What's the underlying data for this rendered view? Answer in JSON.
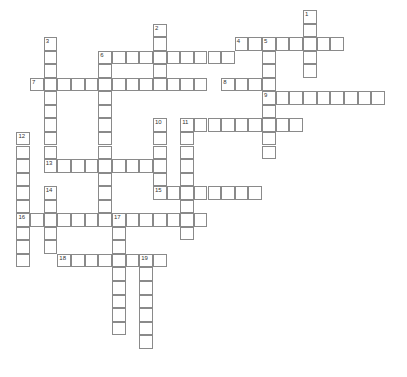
{
  "puzzle": {
    "type": "crossword",
    "grid": {
      "origin_x": 16.4,
      "origin_y": 10,
      "cell_w": 13.65,
      "cell_h": 13.55
    },
    "entries": [
      {
        "number": "1",
        "direction": "down",
        "col": 21,
        "row": 0,
        "length": 5
      },
      {
        "number": "2",
        "direction": "down",
        "col": 10,
        "row": 1,
        "length": 5
      },
      {
        "number": "3",
        "direction": "down",
        "col": 2,
        "row": 2,
        "length": 10
      },
      {
        "number": "4",
        "direction": "across",
        "col": 16,
        "row": 2,
        "length": 8
      },
      {
        "number": "5",
        "direction": "down",
        "col": 18,
        "row": 2,
        "length": 9
      },
      {
        "number": "6",
        "direction": "across",
        "col": 6,
        "row": 3,
        "length": 10
      },
      {
        "number": "6",
        "direction": "down",
        "col": 6,
        "row": 3,
        "length": 13
      },
      {
        "number": "7",
        "direction": "across",
        "col": 1,
        "row": 5,
        "length": 13
      },
      {
        "number": "8",
        "direction": "across",
        "col": 15,
        "row": 5,
        "length": 4
      },
      {
        "number": "9",
        "direction": "across",
        "col": 18,
        "row": 6,
        "length": 9
      },
      {
        "number": "10",
        "direction": "down",
        "col": 10,
        "row": 8,
        "length": 6
      },
      {
        "number": "11",
        "direction": "across",
        "col": 12,
        "row": 8,
        "length": 9
      },
      {
        "number": "11",
        "direction": "down",
        "col": 12,
        "row": 8,
        "length": 9
      },
      {
        "number": "12",
        "direction": "down",
        "col": 0,
        "row": 9,
        "length": 10
      },
      {
        "number": "13",
        "direction": "across",
        "col": 2,
        "row": 11,
        "length": 9
      },
      {
        "number": "14",
        "direction": "down",
        "col": 2,
        "row": 13,
        "length": 5
      },
      {
        "number": "15",
        "direction": "across",
        "col": 10,
        "row": 13,
        "length": 8
      },
      {
        "number": "16",
        "direction": "across",
        "col": 0,
        "row": 15,
        "length": 14
      },
      {
        "number": "17",
        "direction": "down",
        "col": 7,
        "row": 15,
        "length": 9
      },
      {
        "number": "18",
        "direction": "across",
        "col": 3,
        "row": 18,
        "length": 8
      },
      {
        "number": "19",
        "direction": "down",
        "col": 9,
        "row": 18,
        "length": 7
      }
    ]
  }
}
